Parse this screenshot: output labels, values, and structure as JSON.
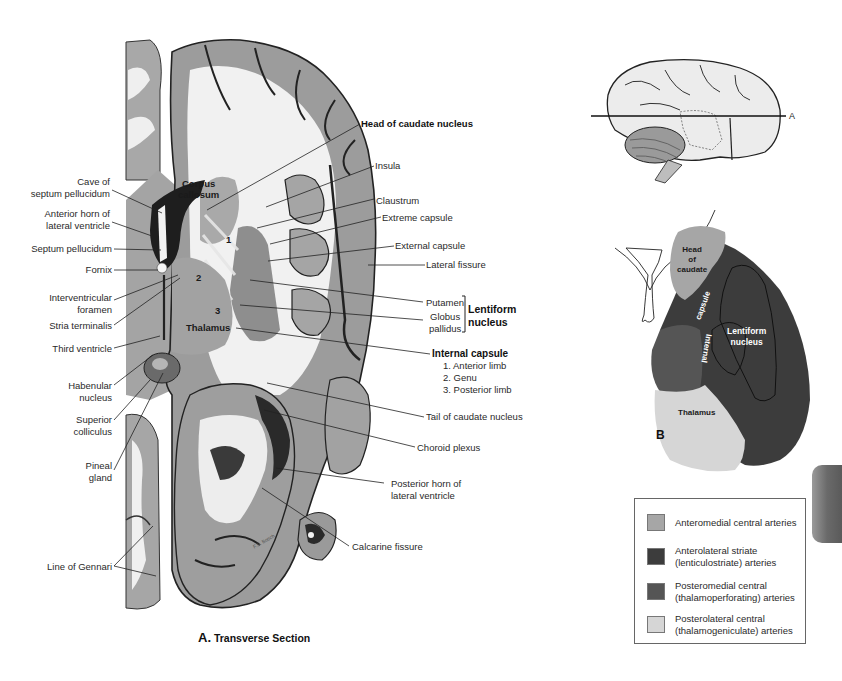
{
  "figure_a": {
    "caption_letter": "A.",
    "caption_text": "Transverse Section",
    "inline_labels": {
      "corpus_callosum": "Corpus\ncallosum",
      "thalamus": "Thalamus",
      "num1": "1",
      "num2": "2",
      "num3": "3",
      "signature": "F.S. Bosch"
    },
    "left_labels": [
      {
        "id": "cave-septum",
        "text": "Cave of\nseptum pellucidum"
      },
      {
        "id": "anterior-horn",
        "text": "Anterior horn of\nlateral ventricle"
      },
      {
        "id": "septum-pellucidum",
        "text": "Septum pellucidum"
      },
      {
        "id": "fornix",
        "text": "Fornix"
      },
      {
        "id": "interventricular-foramen",
        "text": "Interventricular\nforamen"
      },
      {
        "id": "stria-terminalis",
        "text": "Stria terminalis"
      },
      {
        "id": "third-ventricle",
        "text": "Third ventricle"
      },
      {
        "id": "habenular-nucleus",
        "text": "Habenular\nnucleus"
      },
      {
        "id": "superior-colliculus",
        "text": "Superior\ncolliculus"
      },
      {
        "id": "pineal-gland",
        "text": "Pineal\ngland"
      },
      {
        "id": "line-of-gennari",
        "text": "Line of Gennari"
      }
    ],
    "right_labels": [
      {
        "id": "head-caudate",
        "text": "Head of caudate nucleus",
        "bold": true
      },
      {
        "id": "insula",
        "text": "Insula"
      },
      {
        "id": "claustrum",
        "text": "Claustrum"
      },
      {
        "id": "extreme-capsule",
        "text": "Extreme capsule"
      },
      {
        "id": "external-capsule",
        "text": "External capsule"
      },
      {
        "id": "lateral-fissure",
        "text": "Lateral fissure"
      },
      {
        "id": "putamen",
        "text": "Putamen"
      },
      {
        "id": "globus-pallidus",
        "text": "Globus\npallidus"
      },
      {
        "id": "lentiform-nucleus",
        "text": "Lentiform\nnucleus",
        "bold": true
      },
      {
        "id": "internal-capsule",
        "text": "Internal capsule",
        "bold": true
      },
      {
        "id": "anterior-limb",
        "text": "1. Anterior limb"
      },
      {
        "id": "genu",
        "text": "2. Genu"
      },
      {
        "id": "posterior-limb",
        "text": "3. Posterior limb"
      },
      {
        "id": "tail-caudate",
        "text": "Tail of caudate nucleus"
      },
      {
        "id": "choroid-plexus",
        "text": "Choroid plexus"
      },
      {
        "id": "posterior-horn",
        "text": "Posterior horn of\nlateral ventricle"
      },
      {
        "id": "calcarine-fissure",
        "text": "Calcarine fissure"
      }
    ]
  },
  "orientation_view": {
    "plane_marker": "A"
  },
  "figure_b": {
    "letter": "B",
    "labels": {
      "head_of_caudate": "Head\nof\ncaudate",
      "capsule": "capsule",
      "internal": "Internal",
      "lentiform_nucleus": "Lentiform\nnucleus",
      "thalamus": "Thalamus"
    }
  },
  "legend": {
    "items": [
      {
        "text": "Anteromedial central arteries",
        "color": "#a6a6a6"
      },
      {
        "text": "Anterolateral striate\n(lenticulostriate) arteries",
        "color": "#3c3c3c"
      },
      {
        "text": "Posteromedial central\n(thalamoperforating) arteries",
        "color": "#555555"
      },
      {
        "text": "Posterolateral central\n(thalamogeniculate) arteries",
        "color": "#d6d6d6"
      }
    ]
  },
  "colors": {
    "anteromedial": "#a6a6a6",
    "anterolateral": "#3c3c3c",
    "posteromedial": "#555555",
    "posterolateral": "#d6d6d6",
    "gray_matter": "#9a9a9a",
    "white_matter": "#f2f2f2"
  }
}
